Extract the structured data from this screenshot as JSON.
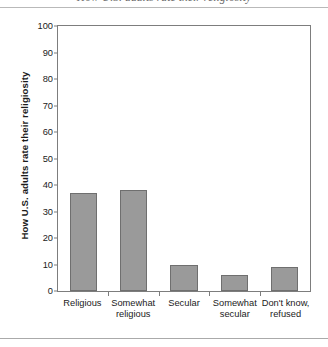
{
  "page": {
    "caption_partial": "How U.S. adults rate their religiosity",
    "rule_top": "horizontal-rule",
    "rule_bottom": "horizontal-rule"
  },
  "chart_data": {
    "type": "bar",
    "title": "",
    "xlabel": "",
    "ylabel": "How U.S. adults rate their religiosity",
    "categories": [
      "Religious",
      "Somewhat religious",
      "Secular",
      "Somewhat secular",
      "Don't know, refused"
    ],
    "category_lines": [
      [
        "Religious"
      ],
      [
        "Somewhat",
        "religious"
      ],
      [
        "Secular"
      ],
      [
        "Somewhat",
        "secular"
      ],
      [
        "Don't know,",
        "refused"
      ]
    ],
    "values": [
      37,
      38,
      10,
      6,
      9
    ],
    "ylim": [
      0,
      100
    ],
    "yticks": [
      0,
      10,
      20,
      30,
      40,
      50,
      60,
      70,
      80,
      90,
      100
    ],
    "ytick_labels": [
      "0",
      "10",
      "20",
      "30",
      "40",
      "50",
      "60",
      "70",
      "80",
      "90",
      "100"
    ],
    "grid": false,
    "legend": false,
    "bar_color": "#9a9a9a",
    "bar_edge_color": "#6f6f6f",
    "axis_color": "#7d7d7d",
    "background": "#ffffff"
  }
}
